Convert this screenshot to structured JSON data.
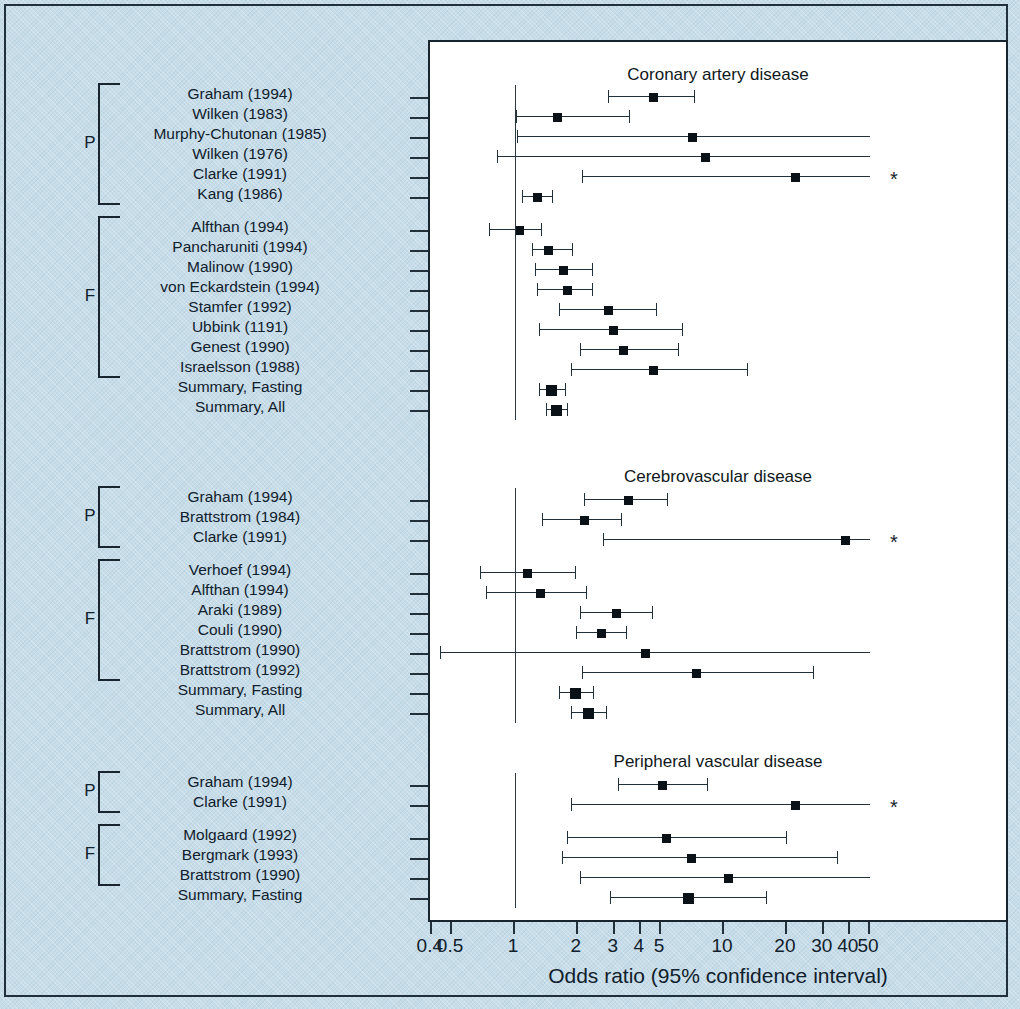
{
  "figure": {
    "background_color": "#c6dce8",
    "plot_background": "#ffffff",
    "ink_color": "#18242e"
  },
  "axis": {
    "title": "Odds ratio (95% confidence interval)",
    "scale": "log",
    "ticks": [
      {
        "value": 0.4,
        "label": "0.4"
      },
      {
        "value": 0.5,
        "label": "0.5"
      },
      {
        "value": 1,
        "label": "1"
      },
      {
        "value": 2,
        "label": "2"
      },
      {
        "value": 3,
        "label": "3"
      },
      {
        "value": 4,
        "label": "4"
      },
      {
        "value": 5,
        "label": "5"
      },
      {
        "value": 10,
        "label": "10"
      },
      {
        "value": 20,
        "label": "20"
      },
      {
        "value": 30,
        "label": "30"
      },
      {
        "value": 40,
        "label": "40"
      },
      {
        "value": 50,
        "label": "50"
      }
    ],
    "reference_value": 1,
    "xlim": [
      0.37,
      57
    ]
  },
  "annotations": {
    "group_prospective": "P",
    "group_fasting": "F",
    "methionine_marker": "M",
    "truncated_marker": "*"
  },
  "chart_data": {
    "type": "forest",
    "title": "Odds ratio (95% confidence interval)",
    "xlabel": "Odds ratio (95% confidence interval)",
    "ylabel": "",
    "xscale": "log",
    "xlim": [
      0.37,
      57
    ],
    "reference_line": 1,
    "panels": [
      {
        "title": "Coronary artery disease",
        "groups": [
          {
            "group_label": "P",
            "studies": [
              {
                "label": "Graham (1994)",
                "m": false,
                "or": 4.6,
                "lo": 2.8,
                "hi": 7.3,
                "truncated_right": false,
                "truncated_left": false,
                "star": false
              },
              {
                "label": "Wilken (1983)",
                "m": true,
                "or": 1.6,
                "lo": 1.01,
                "hi": 3.55,
                "truncated_right": false,
                "truncated_left": false,
                "star": false
              },
              {
                "label": "Murphy-Chutonan (1985)",
                "m": true,
                "or": 7.1,
                "lo": 1.02,
                "hi": 50,
                "truncated_right": true,
                "truncated_left": false,
                "star": false
              },
              {
                "label": "Wilken (1976)",
                "m": true,
                "or": 8.2,
                "lo": 0.82,
                "hi": 50,
                "truncated_right": true,
                "truncated_left": false,
                "star": false
              },
              {
                "label": "Clarke (1991)",
                "m": false,
                "or": 22.0,
                "lo": 2.1,
                "hi": 50,
                "truncated_right": true,
                "truncated_left": false,
                "star": true
              },
              {
                "label": "Kang (1986)",
                "m": false,
                "or": 1.28,
                "lo": 1.08,
                "hi": 1.52,
                "truncated_right": false,
                "truncated_left": false,
                "star": false
              }
            ]
          },
          {
            "group_label": "F",
            "studies": [
              {
                "label": "Alfthan (1994)",
                "m": false,
                "or": 1.05,
                "lo": 0.75,
                "hi": 1.35,
                "truncated_right": false,
                "truncated_left": false,
                "star": false
              },
              {
                "label": "Pancharuniti (1994)",
                "m": true,
                "or": 1.45,
                "lo": 1.2,
                "hi": 1.9,
                "truncated_right": false,
                "truncated_left": false,
                "star": false
              },
              {
                "label": "Malinow (1990)",
                "m": false,
                "or": 1.7,
                "lo": 1.25,
                "hi": 2.35,
                "truncated_right": false,
                "truncated_left": false,
                "star": false
              },
              {
                "label": "von Eckardstein (1994)",
                "m": true,
                "or": 1.78,
                "lo": 1.28,
                "hi": 2.35,
                "truncated_right": false,
                "truncated_left": false,
                "star": false
              },
              {
                "label": "Stamfer (1992)",
                "m": true,
                "or": 2.8,
                "lo": 1.62,
                "hi": 4.8,
                "truncated_right": false,
                "truncated_left": false,
                "star": false
              },
              {
                "label": "Ubbink (1191)",
                "m": true,
                "or": 2.95,
                "lo": 1.3,
                "hi": 6.4,
                "truncated_right": false,
                "truncated_left": false,
                "star": false
              },
              {
                "label": "Genest (1990)",
                "m": true,
                "or": 3.3,
                "lo": 2.05,
                "hi": 6.1,
                "truncated_right": false,
                "truncated_left": false,
                "star": false
              },
              {
                "label": "Israelsson (1988)",
                "m": true,
                "or": 4.6,
                "lo": 1.85,
                "hi": 13.0,
                "truncated_right": false,
                "truncated_left": false,
                "star": false
              },
              {
                "label": "Summary, Fasting",
                "m": false,
                "or": 1.5,
                "lo": 1.3,
                "hi": 1.75,
                "truncated_right": false,
                "truncated_left": false,
                "star": false,
                "summary": true
              },
              {
                "label": "Summary, All",
                "m": false,
                "or": 1.58,
                "lo": 1.4,
                "hi": 1.8,
                "truncated_right": false,
                "truncated_left": false,
                "star": false,
                "summary": true
              }
            ]
          }
        ],
        "extra_row": {
          "label": "Israelsson row axis",
          "or": 4.6,
          "lo": 0.55,
          "hi": 50
        }
      },
      {
        "title": "Cerebrovascular disease",
        "groups": [
          {
            "group_label": "P",
            "studies": [
              {
                "label": "Graham (1994)",
                "m": false,
                "or": 3.5,
                "lo": 2.15,
                "hi": 5.4,
                "truncated_right": false,
                "truncated_left": false,
                "star": false
              },
              {
                "label": "Brattstrom (1984)",
                "m": false,
                "or": 2.15,
                "lo": 1.35,
                "hi": 3.25,
                "truncated_right": false,
                "truncated_left": false,
                "star": false
              },
              {
                "label": "Clarke (1991)",
                "m": false,
                "or": 38.0,
                "lo": 2.65,
                "hi": 50,
                "truncated_right": true,
                "truncated_left": false,
                "star": true
              }
            ]
          },
          {
            "group_label": "F",
            "studies": [
              {
                "label": "Verhoef (1994)",
                "m": true,
                "or": 1.15,
                "lo": 0.68,
                "hi": 1.95,
                "truncated_right": false,
                "truncated_left": false,
                "star": false
              },
              {
                "label": "Alfthan (1994)",
                "m": false,
                "or": 1.32,
                "lo": 0.73,
                "hi": 2.2,
                "truncated_right": false,
                "truncated_left": false,
                "star": false
              },
              {
                "label": "Araki (1989)",
                "m": false,
                "or": 3.05,
                "lo": 2.05,
                "hi": 4.55,
                "truncated_right": false,
                "truncated_left": false,
                "star": false
              },
              {
                "label": "Couli (1990)",
                "m": false,
                "or": 2.6,
                "lo": 1.95,
                "hi": 3.45,
                "truncated_right": false,
                "truncated_left": false,
                "star": false
              },
              {
                "label": "Brattstrom (1990)",
                "m": false,
                "or": 4.2,
                "lo": 0.44,
                "hi": 50,
                "truncated_right": true,
                "truncated_left": false,
                "star": false
              },
              {
                "label": "Brattstrom (1992)",
                "m": false,
                "or": 7.4,
                "lo": 2.1,
                "hi": 27.0,
                "truncated_right": false,
                "truncated_left": false,
                "star": false
              },
              {
                "label": "Summary, Fasting",
                "m": false,
                "or": 1.95,
                "lo": 1.62,
                "hi": 2.4,
                "truncated_right": false,
                "truncated_left": false,
                "star": false,
                "summary": true
              },
              {
                "label": "Summary, All",
                "m": false,
                "or": 2.25,
                "lo": 1.85,
                "hi": 2.75,
                "truncated_right": false,
                "truncated_left": false,
                "star": false,
                "summary": true
              }
            ]
          }
        ]
      },
      {
        "title": "Peripheral vascular disease",
        "groups": [
          {
            "group_label": "P",
            "studies": [
              {
                "label": "Graham (1994)",
                "m": false,
                "or": 5.1,
                "lo": 3.1,
                "hi": 8.4,
                "truncated_right": false,
                "truncated_left": false,
                "star": false
              },
              {
                "label": "Clarke (1991)",
                "m": false,
                "or": 22.0,
                "lo": 1.85,
                "hi": 50,
                "truncated_right": true,
                "truncated_left": false,
                "star": true
              }
            ]
          },
          {
            "group_label": "F",
            "studies": [
              {
                "label": "Molgaard (1992)",
                "m": false,
                "or": 5.3,
                "lo": 1.78,
                "hi": 20.0,
                "truncated_right": false,
                "truncated_left": false,
                "star": false
              },
              {
                "label": "Bergmark (1993)",
                "m": false,
                "or": 7.0,
                "lo": 1.68,
                "hi": 35.0,
                "truncated_right": false,
                "truncated_left": false,
                "star": false
              },
              {
                "label": "Brattstrom (1990)",
                "m": false,
                "or": 10.5,
                "lo": 2.05,
                "hi": 50,
                "truncated_right": true,
                "truncated_left": false,
                "star": false
              },
              {
                "label": "Summary, Fasting",
                "m": false,
                "or": 6.8,
                "lo": 2.85,
                "hi": 16.0,
                "truncated_right": false,
                "truncated_left": false,
                "star": false,
                "summary": true
              }
            ]
          }
        ]
      }
    ]
  }
}
